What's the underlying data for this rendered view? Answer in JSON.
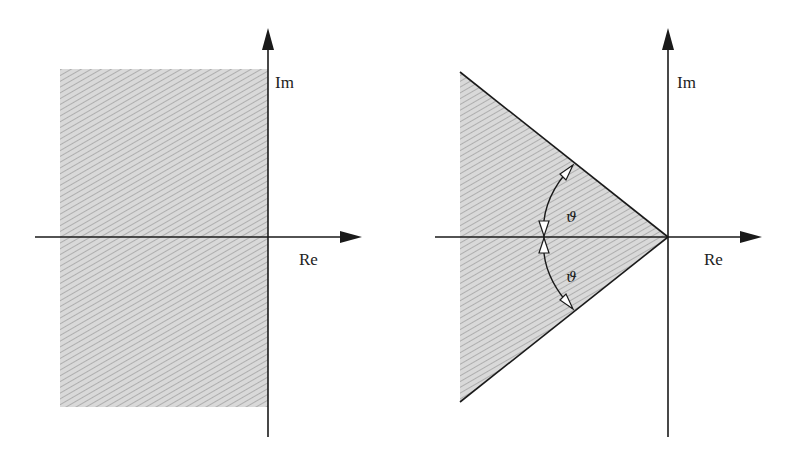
{
  "figure": {
    "colors": {
      "axis": "#1a1a1a",
      "region_fill": "#d6d6d6",
      "hatch": "#9a9a9a",
      "text": "#222222"
    },
    "left_panel": {
      "name": "half-plane region",
      "im_label": "Im",
      "re_label": "Re",
      "region": "left half-plane (Re < 0)"
    },
    "right_panel": {
      "name": "sector region",
      "im_label": "Im",
      "re_label": "Re",
      "region": "sector with vertex at origin opening to the left",
      "angle_label_upper": "ϑ",
      "angle_label_lower": "ϑ"
    }
  }
}
